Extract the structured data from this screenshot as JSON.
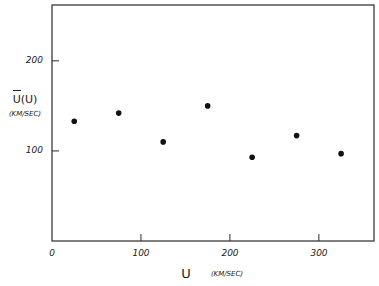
{
  "chart_data": {
    "type": "scatter",
    "title": "",
    "xlabel": "U",
    "xlabel_units": "(KM/SEC)",
    "ylabel": "U(U)",
    "ylabel_overbar": true,
    "ylabel_units": "(KM/SEC)",
    "xlim": [
      0,
      362
    ],
    "ylim": [
      0,
      262
    ],
    "xticks": [
      0,
      100,
      200,
      300
    ],
    "yticks": [
      100,
      200
    ],
    "grid": false,
    "legend": null,
    "series": [
      {
        "name": "mean velocity",
        "x": [
          25,
          75,
          125,
          175,
          225,
          275,
          325
        ],
        "y": [
          133,
          142,
          110,
          150,
          93,
          117,
          97
        ]
      }
    ]
  },
  "labels": {
    "x_tick_0": "0",
    "x_tick_100": "100",
    "x_tick_200": "200",
    "x_tick_300": "300",
    "y_tick_100": "100",
    "y_tick_200": "200",
    "x_title": "U",
    "x_units": "(KM/SEC)",
    "y_title": "U(U)",
    "y_units": "(KM/SEC)"
  }
}
